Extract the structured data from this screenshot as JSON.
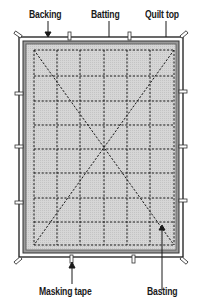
{
  "labels": {
    "backing": "Backing",
    "batting": "Batting",
    "quilt_top": "Quilt top",
    "masking_tape": "Masking tape",
    "basting": "Basting"
  },
  "colors": {
    "line": "#1a1a1a",
    "backing_fill": "#ffffff",
    "batting_fill": "#bdbdbd",
    "quilt_fill": "#d4d4d4",
    "tape_fill": "#ffffff"
  },
  "grid": {
    "columns": 6,
    "rows": 8
  }
}
